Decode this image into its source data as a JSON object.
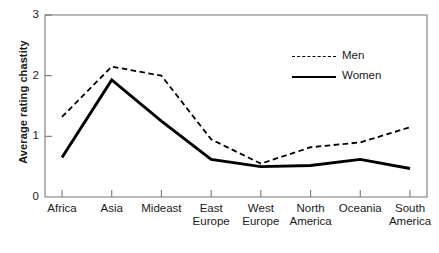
{
  "chart_data": {
    "type": "line",
    "title": "",
    "xlabel": "",
    "ylabel": "Average rating chastity",
    "ylim": [
      0,
      3
    ],
    "yticks": [
      0,
      1,
      2,
      3
    ],
    "ytick_labels": [
      "0",
      "1",
      "2",
      "3"
    ],
    "grid": false,
    "legend_position": "top-right",
    "categories": [
      "Africa",
      "Asia",
      "Mideast",
      "East Europe",
      "West Europe",
      "North America",
      "Oceania",
      "South America"
    ],
    "category_lines": [
      [
        "Africa"
      ],
      [
        "Asia"
      ],
      [
        "Mideast"
      ],
      [
        "East",
        "Europe"
      ],
      [
        "West",
        "Europe"
      ],
      [
        "North",
        "America"
      ],
      [
        "Oceania"
      ],
      [
        "South",
        "America"
      ]
    ],
    "series": [
      {
        "name": "Men",
        "style": "dashed",
        "color": "#000000",
        "values": [
          1.32,
          2.15,
          2.0,
          0.95,
          0.55,
          0.82,
          0.9,
          1.15
        ]
      },
      {
        "name": "Women",
        "style": "solid",
        "color": "#000000",
        "values": [
          0.65,
          1.93,
          1.25,
          0.62,
          0.5,
          0.52,
          0.62,
          0.47
        ]
      }
    ]
  },
  "legend": {
    "items": [
      {
        "label": "Men",
        "style": "dashed"
      },
      {
        "label": "Women",
        "style": "solid"
      }
    ]
  }
}
